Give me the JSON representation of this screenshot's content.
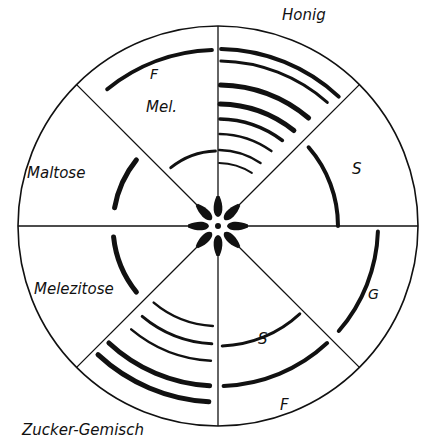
{
  "labels": {
    "honig": "Honig",
    "maltose": "Maltose",
    "mel": "Mel.",
    "f_top": "F",
    "melezitose": "Melezitose",
    "zucker_gemisch": "Zucker-Gemisch",
    "s_right": "S",
    "g_right": "G",
    "s_bottom": "S",
    "f_bottom": "F"
  },
  "geometry": {
    "center": [
      218,
      226
    ],
    "radius": 200,
    "sector_count": 8
  },
  "sectors": [
    {
      "name": "Honig",
      "position": "top-right",
      "bands": [
        {
          "r": 177,
          "w": 4
        },
        {
          "r": 165,
          "w": 3
        },
        {
          "r": 141,
          "w": 5
        },
        {
          "r": 122,
          "w": 5
        },
        {
          "r": 107,
          "w": 3.5
        },
        {
          "r": 92,
          "w": 2.5
        },
        {
          "r": 76,
          "w": 2.5
        },
        {
          "r": 63,
          "w": 2
        }
      ]
    },
    {
      "name": "Saccharose (S)",
      "position": "right-upper",
      "bands": [
        {
          "r": 120,
          "w": 4
        }
      ]
    },
    {
      "name": "Glucose (G)",
      "position": "right-lower",
      "bands": [
        {
          "r": 160,
          "w": 4
        }
      ]
    },
    {
      "name": "Saccharose/Fructose (S, F)",
      "position": "bottom-right",
      "bands": [
        {
          "r": 120,
          "w": 3
        },
        {
          "r": 160,
          "w": 4
        }
      ]
    },
    {
      "name": "Zucker-Gemisch",
      "position": "bottom-left",
      "bands": [
        {
          "r": 100,
          "w": 2.5
        },
        {
          "r": 118,
          "w": 3
        },
        {
          "r": 135,
          "w": 2.5
        },
        {
          "r": 160,
          "w": 5
        },
        {
          "r": 176,
          "w": 5
        }
      ]
    },
    {
      "name": "Melezitose",
      "position": "left-lower",
      "bands": [
        {
          "r": 105,
          "w": 5
        }
      ]
    },
    {
      "name": "Maltose",
      "position": "left-upper",
      "bands": [
        {
          "r": 105,
          "w": 5
        }
      ]
    },
    {
      "name": "Melibiose/Fructose (Mel., F)",
      "position": "top-left",
      "bands": [
        {
          "r": 75,
          "w": 3
        },
        {
          "r": 176,
          "w": 4
        }
      ]
    }
  ]
}
